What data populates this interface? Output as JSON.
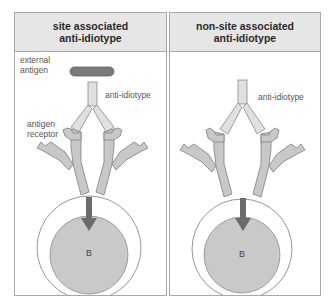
{
  "panels": [
    {
      "title_line1": "site associated",
      "title_line2": "anti-idiotype",
      "labels": {
        "external_antigen_line1": "external",
        "external_antigen_line2": "antigen",
        "anti_idiotype": "anti-idiotype",
        "antigen_receptor_line1": "antigen",
        "antigen_receptor_line2": "receptor",
        "cell": "B"
      }
    },
    {
      "title_line1": "non-site associated",
      "title_line2": "anti-idiotype",
      "labels": {
        "anti_idiotype": "anti-idiotype",
        "cell": "B"
      }
    }
  ],
  "colors": {
    "header_bg": "#e6e6e6",
    "border": "#a8a8a8",
    "antibody_fill": "#dcdcdc",
    "receptor_fill": "#c8c8c8",
    "antigen_fill": "#7a7a7a",
    "cell_nucleus_fill": "#c9c9c9",
    "arrow_fill": "#6b6b6b"
  }
}
